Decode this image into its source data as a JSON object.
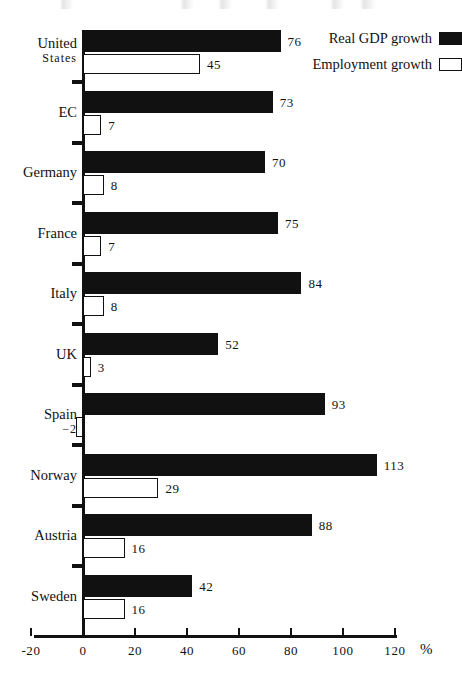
{
  "chart_data": {
    "type": "bar",
    "orientation": "horizontal",
    "title": "",
    "subtitle": "",
    "xlabel": "%",
    "ylabel": "",
    "xlim": [
      -20,
      120
    ],
    "xticks": [
      -20,
      0,
      20,
      40,
      60,
      80,
      100,
      120
    ],
    "xtick_labels": [
      "-20",
      "0",
      "20",
      "40",
      "60",
      "80",
      "100",
      "120"
    ],
    "grid": false,
    "legend_position": "top-right",
    "categories": [
      "United States",
      "EC",
      "Germany",
      "France",
      "Italy",
      "UK",
      "Spain",
      "Norway",
      "Austria",
      "Sweden"
    ],
    "category_lines": [
      [
        "United",
        "States"
      ],
      [
        "EC"
      ],
      [
        "Germany"
      ],
      [
        "France"
      ],
      [
        "Italy"
      ],
      [
        "UK"
      ],
      [
        "Spain"
      ],
      [
        "Norway"
      ],
      [
        "Austria"
      ],
      [
        "Sweden"
      ]
    ],
    "series": [
      {
        "name": "Real GDP growth",
        "style": "filled",
        "color": "#111111",
        "values": [
          76,
          73,
          70,
          75,
          84,
          52,
          93,
          113,
          88,
          42
        ],
        "value_labels": [
          "76",
          "73",
          "70",
          "75",
          "84",
          "52",
          "93",
          "113",
          "88",
          "42"
        ]
      },
      {
        "name": "Employment growth",
        "style": "hollow",
        "color": "#ffffff",
        "values": [
          45,
          7,
          8,
          7,
          8,
          3,
          -2,
          29,
          16,
          16
        ],
        "value_labels": [
          "45",
          "7",
          "8",
          "7",
          "8",
          "3",
          "-2",
          "29",
          "16",
          "16"
        ]
      }
    ]
  },
  "legend": {
    "items": [
      {
        "label": "Real GDP growth",
        "swatch": "filled"
      },
      {
        "label": "Employment growth",
        "swatch": "hollow"
      }
    ]
  },
  "axis": {
    "unit": "%",
    "zero_label": "0"
  },
  "colors": {
    "ink": "#111111",
    "paper": "#ffffff"
  }
}
